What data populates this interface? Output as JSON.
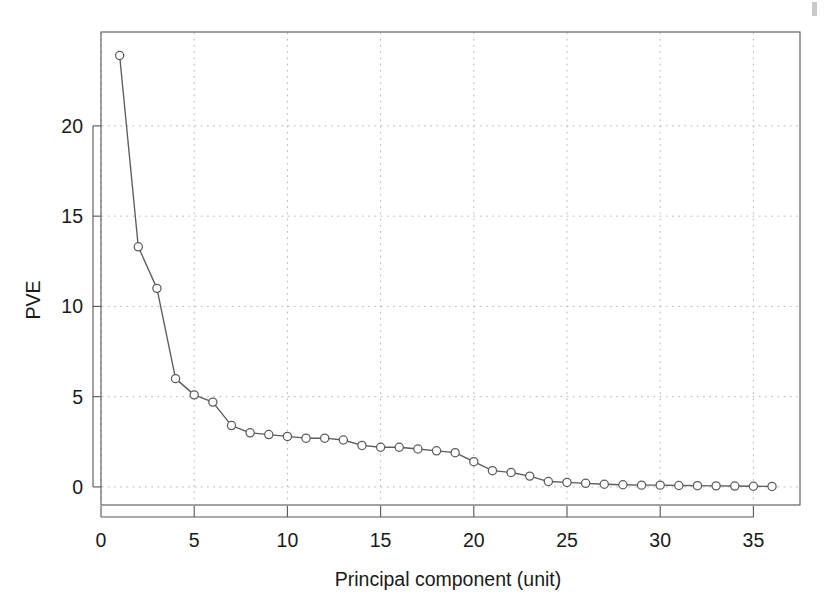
{
  "chart_data": {
    "type": "line",
    "title": "",
    "xlabel": "Principal component (unit)",
    "ylabel": "PVE",
    "xlim": [
      0.0,
      37.5
    ],
    "ylim": [
      -1.0,
      25.2
    ],
    "xticks": [
      0,
      5,
      10,
      15,
      20,
      25,
      30,
      35
    ],
    "xtick_labels": [
      "0",
      "5",
      "10",
      "15",
      "20",
      "25",
      "30",
      "35"
    ],
    "yticks": [
      0,
      5,
      10,
      15,
      20
    ],
    "ytick_labels": [
      "0",
      "5",
      "10",
      "15",
      "20"
    ],
    "grid": true,
    "grid_style": "dotted",
    "legend": "none",
    "marker": "open-circle",
    "line_color": "#5c5c5c",
    "marker_fill": "#ffffff",
    "grid_color": "#b9b9b9",
    "axis_color": "#555555",
    "series": [
      {
        "name": "PVE",
        "x": [
          1,
          2,
          3,
          4,
          5,
          6,
          7,
          8,
          9,
          10,
          11,
          12,
          13,
          14,
          15,
          16,
          17,
          18,
          19,
          20,
          21,
          22,
          23,
          24,
          25,
          26,
          27,
          28,
          29,
          30,
          31,
          32,
          33,
          34,
          35,
          36
        ],
        "values": [
          23.9,
          13.3,
          11.0,
          6.0,
          5.1,
          4.7,
          3.4,
          3.0,
          2.9,
          2.8,
          2.7,
          2.7,
          2.6,
          2.3,
          2.2,
          2.2,
          2.1,
          2.0,
          1.9,
          1.4,
          0.9,
          0.8,
          0.6,
          0.3,
          0.25,
          0.2,
          0.15,
          0.12,
          0.1,
          0.1,
          0.08,
          0.07,
          0.06,
          0.05,
          0.04,
          0.03
        ]
      }
    ]
  },
  "figure": {
    "background_color": "#ffffff",
    "artifact_label": "scan-smudge"
  }
}
